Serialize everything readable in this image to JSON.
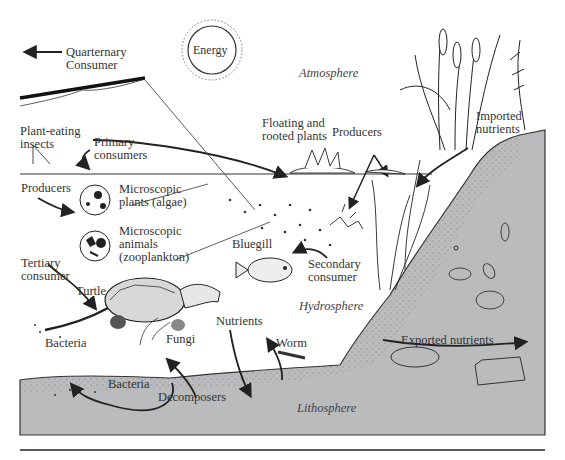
{
  "figure": {
    "type": "aquatic ecosystem diagram",
    "regions": {
      "atmosphere": "Atmosphere",
      "hydrosphere": "Hydrosphere",
      "lithosphere": "Lithosphere"
    },
    "energy_source": "Energy",
    "labels": {
      "quarternary_consumer_line1": "Quarternary",
      "quarternary_consumer_line2": "Consumer",
      "plant_eating_insects_line1": "Plant-eating",
      "plant_eating_insects_line2": "insects",
      "primary_consumers_line1": "Primary",
      "primary_consumers_line2": "consumers",
      "producers_left": "Producers",
      "microscopic_plants_line1": "Microscopic",
      "microscopic_plants_line2": "plants (algae)",
      "microscopic_animals_line1": "Microscopic",
      "microscopic_animals_line2": "animals",
      "microscopic_animals_line3": "(zooplankton)",
      "floating_plants_line1": "Floating and",
      "floating_plants_line2": "rooted plants",
      "producers_right": "Producers",
      "imported_nutrients_line1": "Imported",
      "imported_nutrients_line2": "nutrients",
      "bluegill": "Bluegill",
      "secondary_consumer_line1": "Secondary",
      "secondary_consumer_line2": "consumer",
      "tertiary_consumer_line1": "Tertiary",
      "tertiary_consumer_line2": "consumer",
      "turtle": "Turtle",
      "nutrients": "Nutrients",
      "worm": "Worm",
      "fungi": "Fungi",
      "bacteria_surface": "Bacteria",
      "bacteria_soil": "Bacteria",
      "decomposers": "Decomposers",
      "exported_nutrients": "Exported nutrients"
    },
    "colors": {
      "soil": "#b9bbbd",
      "ink": "#2a2a2a",
      "water": "#ffffff"
    }
  }
}
